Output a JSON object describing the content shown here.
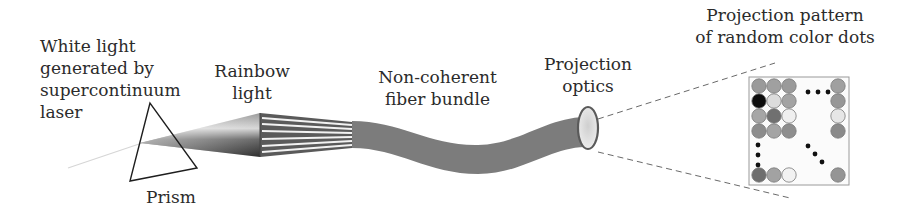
{
  "diagram": {
    "type": "optical setup flow",
    "labels": {
      "source": "White light\ngenerated by\nsupercontinuum\nlaser",
      "prism": "Prism",
      "rainbow": "Rainbow\nlight",
      "fiber": "Non-coherent\nfiber bundle",
      "optics": "Projection\noptics",
      "pattern": "Projection pattern\nof random color dots"
    },
    "components": [
      "supercontinuum laser",
      "prism",
      "rainbow light cone",
      "non-coherent fiber bundle",
      "projection optics lens",
      "dot pattern"
    ],
    "colors": {
      "fiber": "#7a7a7a",
      "lens_rim": "#555555",
      "lens_fill": "#d9d9d9",
      "cone_dark": "#3a3a3a",
      "cone_light": "#cfcfcf",
      "dashed": "#666666",
      "dot_black": "#111111"
    },
    "pattern_grid": {
      "top_block_rows": [
        [
          "#9a9a9a",
          "#a0a0a0",
          "#9a9a9a"
        ],
        [
          "#0d0d0d",
          "#dcdcdc",
          "#a3a3a3"
        ],
        [
          "#a6a6a6",
          "#707070",
          "#efefef"
        ],
        [
          "#8c8c8c",
          "#a4a4a4",
          "#8e8e8e"
        ]
      ],
      "right_column": [
        "#a0a0a0",
        "#979797",
        "#e6e6e6",
        "#8a8a8a"
      ],
      "bottom_row": [
        "#6e6e6e",
        "#a2a2a2",
        "#f2f2f2"
      ],
      "bottom_right": "#959595"
    }
  }
}
